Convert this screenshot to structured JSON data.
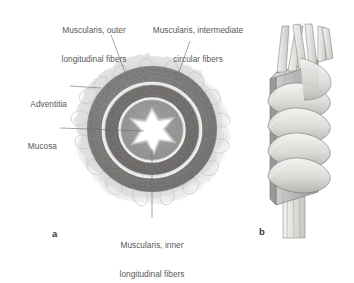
{
  "figure": {
    "type": "anatomical-histology-diagram",
    "background_color": "#ffffff",
    "text_color": "#58585a"
  },
  "labels": {
    "outer_longitudinal": {
      "line1": "Muscularis, outer",
      "line2": "longitudinal fibers"
    },
    "intermediate_circular": {
      "line1": "Muscularis, intermediate",
      "line2": "circular fibers"
    },
    "adventitia": {
      "line1": "Adventitia"
    },
    "mucosa": {
      "line1": "Mucosa"
    },
    "inner_longitudinal": {
      "line1": "Muscularis, inner",
      "line2": "longitudinal fibers"
    }
  },
  "panels": [
    {
      "id": "a",
      "caption": "a",
      "description": "histologic cross-section"
    },
    {
      "id": "b",
      "caption": "b",
      "description": "three-dimensional fiber schematic"
    }
  ],
  "colors": {
    "adventitia": "#d8d6d4",
    "outer_longitudinal_muscle": "#8f8d8b",
    "circular_muscle": "#7c7a78",
    "inner_longitudinal_muscle": "#a3a19f",
    "mucosa_lumen": "#ffffff",
    "light_band": "#e2e0de",
    "schematic_block": "#b9b7b5",
    "schematic_fiber": "#e8e6e3",
    "leader_line": "#6e6e70"
  }
}
